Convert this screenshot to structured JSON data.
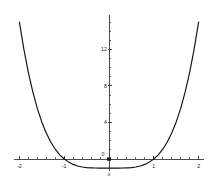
{
  "chart_data": {
    "type": "line",
    "title": "",
    "subtitle": "",
    "xlabel": "x",
    "ylabel": "",
    "xlim": [
      -2.12,
      2.12
    ],
    "ylim": [
      -1.6,
      15.6
    ],
    "grid": false,
    "legend": null,
    "x_ticks_major": [
      -2,
      -1,
      0,
      1,
      2
    ],
    "x_tick_labels": [
      "-2",
      "-1",
      "0",
      "1",
      "2"
    ],
    "x_ticks_minor": [
      -1.8,
      -1.6,
      -1.4,
      -1.2,
      -0.8,
      -0.6,
      -0.4,
      -0.2,
      0.2,
      0.4,
      0.6,
      0.8,
      1.2,
      1.4,
      1.6,
      1.8
    ],
    "y_ticks_major": [
      0,
      4,
      8,
      12
    ],
    "y_tick_labels": [
      "0",
      "4",
      "8",
      "12"
    ],
    "y_ticks_minor": [
      1,
      2,
      3,
      5,
      6,
      7,
      9,
      10,
      11,
      13,
      14,
      15
    ],
    "series": [
      {
        "name": "y = x^4 - 1",
        "x": [
          -2.0,
          -1.9,
          -1.8,
          -1.7,
          -1.6,
          -1.5,
          -1.4,
          -1.3,
          -1.2,
          -1.1,
          -1.0,
          -0.9,
          -0.8,
          -0.7,
          -0.6,
          -0.5,
          -0.4,
          -0.3,
          -0.2,
          -0.1,
          0.0,
          0.1,
          0.2,
          0.3,
          0.4,
          0.5,
          0.6,
          0.7,
          0.8,
          0.9,
          1.0,
          1.1,
          1.2,
          1.3,
          1.4,
          1.5,
          1.6,
          1.7,
          1.8,
          1.9,
          2.0
        ],
        "y": [
          15.0,
          12.03,
          9.49,
          7.35,
          5.55,
          4.06,
          2.84,
          1.86,
          1.07,
          0.46,
          0.0,
          -0.34,
          -0.59,
          -0.76,
          -0.87,
          -0.94,
          -0.97,
          -0.99,
          -1.0,
          -1.0,
          -1.0,
          -1.0,
          -1.0,
          -0.99,
          -0.97,
          -0.94,
          -0.87,
          -0.76,
          -0.59,
          -0.34,
          0.0,
          0.46,
          1.07,
          1.86,
          2.84,
          4.06,
          5.55,
          7.35,
          9.49,
          12.03,
          15.0
        ]
      }
    ],
    "colors": {
      "curve": "#101010",
      "axis": "#3b3b3b",
      "text": "#1a1a1a",
      "background": "#ffffff"
    },
    "annotations": {
      "x_axis_label_position": "below-origin",
      "roots": [
        -1,
        1
      ],
      "minimum": {
        "x": 0,
        "y": -1
      }
    }
  }
}
